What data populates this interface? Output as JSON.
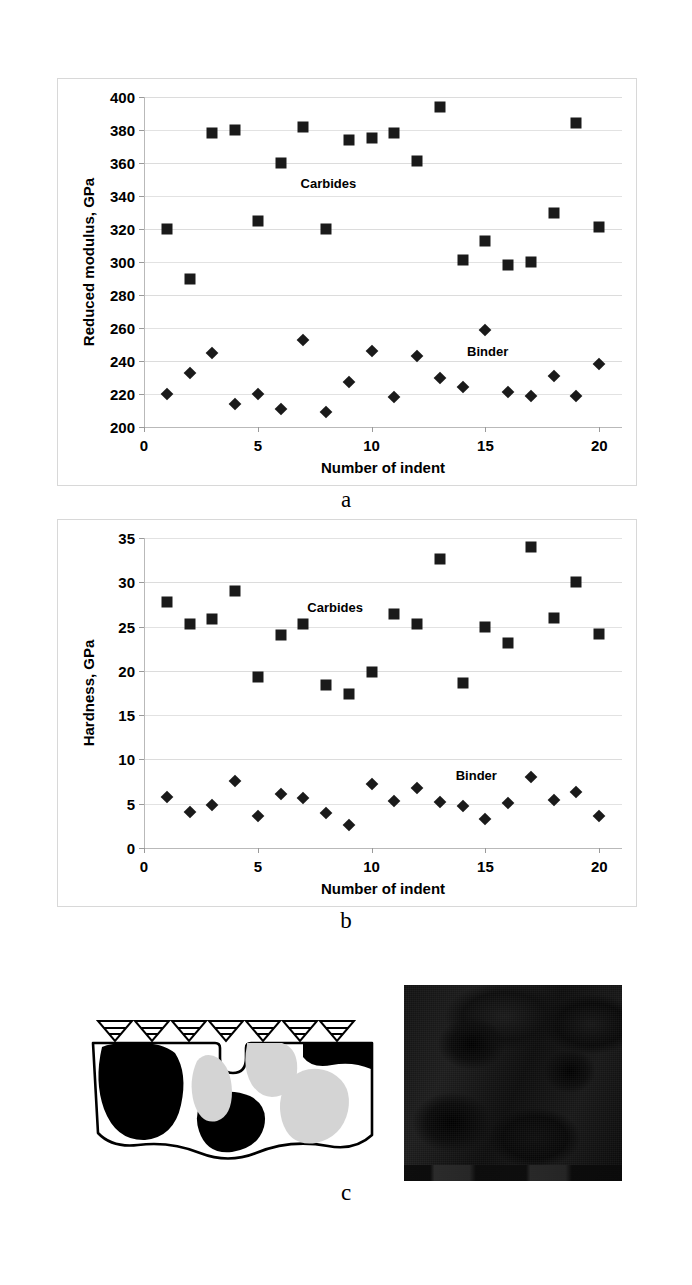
{
  "figure": {
    "panel_letters": [
      "a",
      "b",
      "c"
    ]
  },
  "chart_data": [
    {
      "type": "scatter",
      "panel": "a",
      "title": "",
      "xlabel": "Number of indent",
      "ylabel": "Reduced modulus, GPa",
      "xlim": [
        0,
        21
      ],
      "ylim": [
        200,
        400
      ],
      "xticks": [
        0,
        5,
        10,
        15,
        20
      ],
      "xtick_labels": [
        "0",
        "5",
        "10",
        "15",
        "20"
      ],
      "yticks": [
        200,
        220,
        240,
        260,
        280,
        300,
        320,
        340,
        360,
        380,
        400
      ],
      "ytick_labels": [
        "200",
        "220",
        "240",
        "260",
        "280",
        "300",
        "320",
        "340",
        "360",
        "380",
        "400"
      ],
      "grid": true,
      "legend_position": "inline-annotation",
      "x": [
        1,
        2,
        3,
        4,
        5,
        6,
        7,
        8,
        9,
        10,
        11,
        12,
        13,
        14,
        15,
        16,
        17,
        18,
        19,
        20
      ],
      "series": [
        {
          "name": "Carbides",
          "marker": "square",
          "label_x": 8.1,
          "label_y": 348,
          "values": [
            320,
            290,
            378,
            380,
            325,
            360,
            382,
            320,
            374,
            375,
            378,
            361,
            394,
            301,
            313,
            298,
            300,
            330,
            384,
            321
          ]
        },
        {
          "name": "Binder",
          "marker": "diamond",
          "label_x": 15.1,
          "label_y": 246,
          "values": [
            220,
            233,
            245,
            214,
            220,
            211,
            253,
            209,
            227,
            246,
            218,
            243,
            230,
            224,
            259,
            221,
            219,
            231,
            219,
            238
          ]
        }
      ]
    },
    {
      "type": "scatter",
      "panel": "b",
      "title": "",
      "xlabel": "Number of  indent",
      "ylabel": "Hardness, GPa",
      "xlim": [
        0,
        21
      ],
      "ylim": [
        0,
        35
      ],
      "xticks": [
        0,
        5,
        10,
        15,
        20
      ],
      "xtick_labels": [
        "0",
        "5",
        "10",
        "15",
        "20"
      ],
      "yticks": [
        0,
        5,
        10,
        15,
        20,
        25,
        30,
        35
      ],
      "ytick_labels": [
        "0",
        "5",
        "10",
        "15",
        "20",
        "25",
        "30",
        "35"
      ],
      "grid": true,
      "legend_position": "inline-annotation",
      "x": [
        1,
        2,
        3,
        4,
        5,
        6,
        7,
        8,
        9,
        10,
        11,
        12,
        13,
        14,
        15,
        16,
        17,
        18,
        19,
        20
      ],
      "series": [
        {
          "name": "Carbides",
          "marker": "square",
          "label_x": 8.4,
          "label_y": 27.2,
          "values": [
            27.8,
            25.3,
            25.8,
            29.0,
            19.3,
            24.0,
            25.3,
            18.4,
            17.4,
            19.9,
            26.4,
            25.3,
            32.6,
            18.6,
            25.0,
            23.1,
            34.0,
            26.0,
            30.0,
            24.2
          ]
        },
        {
          "name": "Binder",
          "marker": "diamond",
          "label_x": 14.6,
          "label_y": 8.2,
          "values": [
            5.8,
            4.1,
            4.8,
            7.6,
            3.6,
            6.1,
            5.6,
            4.0,
            2.6,
            7.2,
            5.3,
            6.8,
            5.2,
            4.7,
            3.3,
            5.1,
            8.0,
            5.4,
            6.3,
            3.6
          ]
        }
      ]
    }
  ],
  "schematic": {
    "name": "indentation-schematic",
    "indenter_count": 7,
    "indenter_label": "indenter-tip",
    "description": "cross-section of carbide grains in binder with row of indenter tips on top surface"
  },
  "micrograph": {
    "name": "sem-micrograph",
    "description": "dark scanning electron micrograph of indented surface"
  }
}
